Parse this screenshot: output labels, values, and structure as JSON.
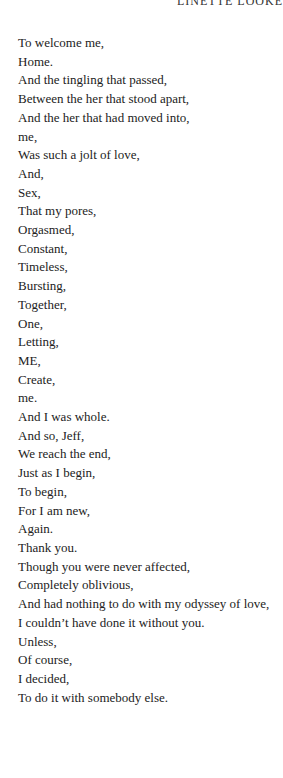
{
  "header": {
    "running_title": "LINETTE LOOKE"
  },
  "poem": {
    "lines": [
      "To welcome me,",
      "Home.",
      "And the tingling that passed,",
      "Between the her that stood apart,",
      "And the her that had moved into,",
      "me,",
      "Was such a jolt of love,",
      "And,",
      "Sex,",
      "That my pores,",
      "Orgasmed,",
      "Constant,",
      "Timeless,",
      "Bursting,",
      "Together,",
      "One,",
      "Letting,",
      "ME,",
      "Create,",
      "me.",
      "And I was whole.",
      "And so, Jeff,",
      "We reach the end,",
      "Just as I begin,",
      "To begin,",
      "For I am new,",
      "Again.",
      "Thank you.",
      "Though you were never affected,",
      "Completely oblivious,",
      "And had nothing to do with my odyssey of love,",
      "I couldn’t have done it without you.",
      "Unless,",
      "Of course,",
      "I decided,",
      "To do it with somebody else."
    ]
  }
}
